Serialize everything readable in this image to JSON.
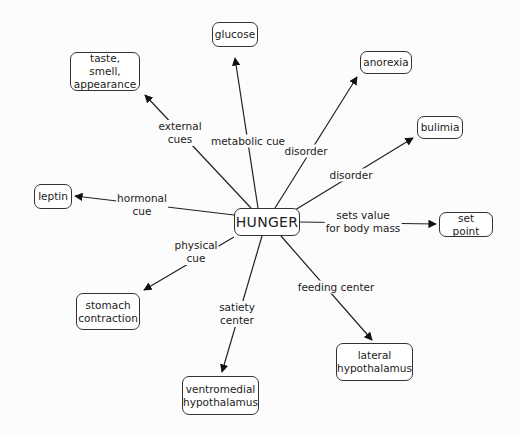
{
  "diagram": {
    "type": "concept-map",
    "center": {
      "id": "hunger",
      "label": "HUNGER"
    },
    "nodes": [
      {
        "id": "hunger",
        "label": "HUNGER",
        "x": 234,
        "y": 208,
        "w": 66,
        "h": 28
      },
      {
        "id": "glucose",
        "label": "glucose",
        "x": 212,
        "y": 22,
        "w": 46,
        "h": 25
      },
      {
        "id": "taste",
        "label": "taste, smell,\nappearance",
        "x": 70,
        "y": 52,
        "w": 70,
        "h": 39
      },
      {
        "id": "anorexia",
        "label": "anorexia",
        "x": 360,
        "y": 51,
        "w": 52,
        "h": 23
      },
      {
        "id": "bulimia",
        "label": "bulimia",
        "x": 417,
        "y": 116,
        "w": 46,
        "h": 23
      },
      {
        "id": "leptin",
        "label": "leptin",
        "x": 34,
        "y": 184,
        "w": 38,
        "h": 25
      },
      {
        "id": "setpoint",
        "label": "set point",
        "x": 439,
        "y": 212,
        "w": 54,
        "h": 25
      },
      {
        "id": "stomach",
        "label": "stomach\ncontraction",
        "x": 76,
        "y": 293,
        "w": 64,
        "h": 37
      },
      {
        "id": "ventromedial",
        "label": "ventromedial\nhypothalamus",
        "x": 182,
        "y": 376,
        "w": 77,
        "h": 39
      },
      {
        "id": "lateral",
        "label": "lateral\nhypothalamus",
        "x": 336,
        "y": 343,
        "w": 77,
        "h": 38
      }
    ],
    "edges": [
      {
        "from": "hunger",
        "to": "glucose",
        "label": "metabolic cue",
        "lx": 248,
        "ly": 141,
        "path": [
          [
            258,
            208
          ],
          [
            235,
            58
          ]
        ]
      },
      {
        "from": "hunger",
        "to": "taste",
        "label": "external\ncues",
        "lx": 180,
        "ly": 133,
        "path": [
          [
            251,
            208
          ],
          [
            145,
            95
          ]
        ]
      },
      {
        "from": "hunger",
        "to": "anorexia",
        "label": "disorder",
        "lx": 306,
        "ly": 151,
        "path": [
          [
            275,
            208
          ],
          [
            357,
            77
          ]
        ]
      },
      {
        "from": "hunger",
        "to": "bulimia",
        "label": "disorder",
        "lx": 351,
        "ly": 175,
        "path": [
          [
            295,
            210
          ],
          [
            413,
            138
          ]
        ]
      },
      {
        "from": "hunger",
        "to": "leptin",
        "label": "hormonal\ncue",
        "lx": 142,
        "ly": 205,
        "path": [
          [
            234,
            215
          ],
          [
            75,
            196
          ]
        ]
      },
      {
        "from": "hunger",
        "to": "setpoint",
        "label": "sets value\nfor body mass",
        "lx": 363,
        "ly": 222,
        "path": [
          [
            300,
            222
          ],
          [
            436,
            224
          ]
        ]
      },
      {
        "from": "hunger",
        "to": "stomach",
        "label": "physical\ncue",
        "lx": 196,
        "ly": 252,
        "path": [
          [
            234,
            237
          ],
          [
            144,
            290
          ]
        ]
      },
      {
        "from": "hunger",
        "to": "ventromedial",
        "label": "satiety\ncenter",
        "lx": 237,
        "ly": 314,
        "path": [
          [
            262,
            236
          ],
          [
            222,
            372
          ]
        ]
      },
      {
        "from": "hunger",
        "to": "lateral",
        "label": "feeding center",
        "lx": 336,
        "ly": 287,
        "path": [
          [
            281,
            236
          ],
          [
            372,
            340
          ]
        ]
      }
    ]
  }
}
